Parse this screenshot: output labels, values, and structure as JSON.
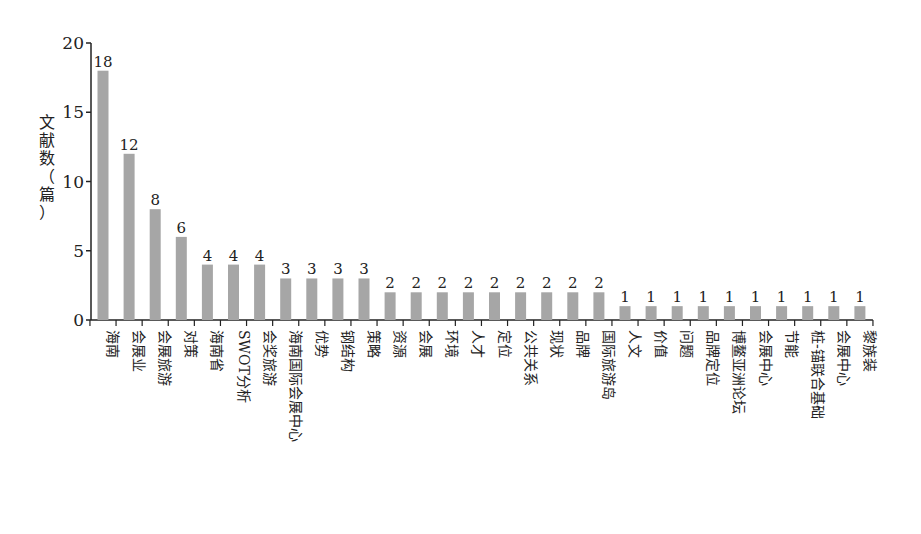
{
  "chart_data": {
    "type": "bar",
    "title": "",
    "xlabel": "",
    "ylabel": "文献数（篇）",
    "ylim": [
      0,
      20
    ],
    "yticks": [
      0,
      5,
      10,
      15,
      20
    ],
    "grid": false,
    "legend": null,
    "bar_color": "#a6a6a6",
    "categories": [
      "海南",
      "会展业",
      "会展旅游",
      "对策",
      "海南省",
      "SWOT分析",
      "会奖旅游",
      "海南国际会展中心",
      "优势",
      "钢结构",
      "策略",
      "资源",
      "会展",
      "环境",
      "人才",
      "定位",
      "公共关系",
      "现状",
      "品牌",
      "国际旅游岛",
      "人文",
      "价值",
      "问题",
      "品牌定位",
      "博鳌亚洲论坛",
      "会展中心",
      "节能",
      "桩-锚联合基础",
      "会展中心",
      "黎族装"
    ],
    "values": [
      18,
      12,
      8,
      6,
      4,
      4,
      4,
      3,
      3,
      3,
      3,
      2,
      2,
      2,
      2,
      2,
      2,
      2,
      2,
      2,
      1,
      1,
      1,
      1,
      1,
      1,
      1,
      1,
      1,
      1
    ],
    "data_labels": true
  }
}
